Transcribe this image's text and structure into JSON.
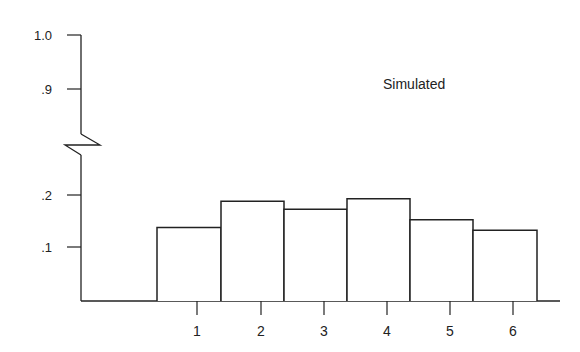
{
  "chart_data": {
    "type": "bar",
    "title": "",
    "annotation": "Simulated",
    "xlabel": "",
    "ylabel": "",
    "categories": [
      "1",
      "2",
      "3",
      "4",
      "5",
      "6"
    ],
    "values": [
      0.14,
      0.19,
      0.175,
      0.195,
      0.155,
      0.135
    ],
    "y_ticks": [
      ".1",
      ".2",
      ".9",
      "1.0"
    ],
    "y_tick_values": [
      0.1,
      0.2,
      0.9,
      1.0
    ],
    "y_axis_break": true,
    "ylim": [
      0,
      1.0
    ],
    "grid": false,
    "legend": null,
    "colors": {
      "stroke": "#222222",
      "fill": "#ffffff"
    }
  }
}
